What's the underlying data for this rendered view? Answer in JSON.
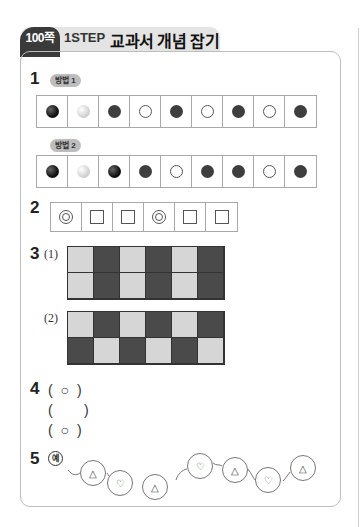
{
  "header": {
    "page_tag": "100쪽",
    "step": "1STEP",
    "title": "교과서 개념 잡기"
  },
  "q1": {
    "number": "1",
    "method1": {
      "label": "방법 1",
      "dots": [
        "black",
        "gray",
        "dark",
        "white",
        "dark",
        "white",
        "dark",
        "white",
        "dark"
      ]
    },
    "method2": {
      "label": "방법 2",
      "dots": [
        "black",
        "gray",
        "black",
        "dark",
        "white",
        "dark",
        "dark",
        "white",
        "dark"
      ]
    }
  },
  "q2": {
    "number": "2",
    "shapes": [
      "double-circle",
      "square",
      "square",
      "double-circle",
      "square",
      "square"
    ]
  },
  "q3": {
    "number": "3",
    "part1": {
      "label": "(1)",
      "rows": [
        [
          "L",
          "D",
          "L",
          "D",
          "L",
          "D"
        ],
        [
          "L",
          "D",
          "L",
          "D",
          "L",
          "D"
        ]
      ]
    },
    "part2": {
      "label": "(2)",
      "rows": [
        [
          "L",
          "D",
          "L",
          "D",
          "L",
          "D"
        ],
        [
          "D",
          "L",
          "D",
          "L",
          "D",
          "L"
        ]
      ]
    }
  },
  "q4": {
    "number": "4",
    "answers": [
      "( ○ )",
      "(     )",
      "( ○ )"
    ]
  },
  "q5": {
    "number": "5",
    "example_label": "예",
    "chain": [
      "△",
      "♡",
      "△",
      "♡",
      "△",
      "♡",
      "△"
    ]
  }
}
